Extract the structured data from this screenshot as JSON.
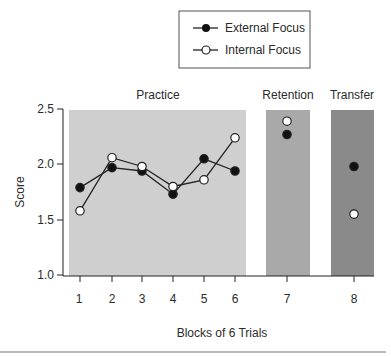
{
  "chart_data": {
    "type": "line",
    "title": "",
    "xlabel": "Blocks of 6 Trials",
    "ylabel": "Score",
    "ylim": [
      1.0,
      2.5
    ],
    "yticks": [
      1.0,
      1.5,
      2.0,
      2.5
    ],
    "ytick_labels": [
      "1.0",
      "1.5",
      "2.0",
      "2.5"
    ],
    "x": [
      1,
      2,
      3,
      4,
      5,
      6,
      7,
      8
    ],
    "xtick_labels": [
      "1",
      "2",
      "3",
      "4",
      "5",
      "6",
      "7",
      "8"
    ],
    "grid": false,
    "legend_position": "top",
    "phases": [
      {
        "name": "Practice",
        "blocks": [
          1,
          2,
          3,
          4,
          5,
          6
        ],
        "color": "#cfcfcf"
      },
      {
        "name": "Retention",
        "blocks": [
          7
        ],
        "color": "#a9a9a9"
      },
      {
        "name": "Transfer",
        "blocks": [
          8
        ],
        "color": "#8a8a8a"
      }
    ],
    "series": [
      {
        "name": "External Focus",
        "marker": "filled-circle",
        "values": [
          1.79,
          1.97,
          1.94,
          1.73,
          2.05,
          1.94,
          2.27,
          1.98
        ],
        "connected_blocks": [
          1,
          2,
          3,
          4,
          5,
          6
        ]
      },
      {
        "name": "Internal Focus",
        "marker": "open-circle",
        "values": [
          1.58,
          2.06,
          1.98,
          1.8,
          1.86,
          2.24,
          2.39,
          1.55
        ],
        "connected_blocks": [
          1,
          2,
          3,
          4,
          5,
          6
        ]
      }
    ]
  },
  "legend": {
    "external": "External Focus",
    "internal": "Internal Focus"
  },
  "axes": {
    "xlabel": "Blocks of 6 Trials",
    "ylabel": "Score"
  },
  "phases": {
    "practice": "Practice",
    "retention": "Retention",
    "transfer": "Transfer"
  }
}
